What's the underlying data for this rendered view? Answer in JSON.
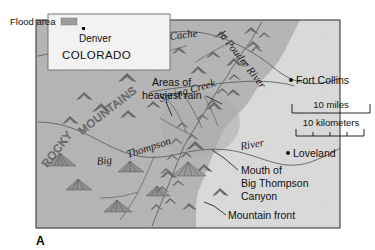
{
  "figure": {
    "label": "A",
    "panel_title": ""
  },
  "inset": {
    "legend_label": "Flood area",
    "legend_swatch_color": "#9b9b9b",
    "city": "Denver",
    "state": "COLORADO",
    "background_color": "#f2f2f2"
  },
  "map": {
    "land_color": "#b5b5b5",
    "plains_color": "#d9d9d9",
    "border_color": "#4a4a4a",
    "cities": [
      {
        "name": "Fort Collins",
        "x": 291,
        "y": 80
      },
      {
        "name": "Loveland",
        "x": 288,
        "y": 153
      }
    ],
    "rivers": [
      {
        "name": "Cache",
        "style": "italic-serif"
      },
      {
        "name": "la Poudre River",
        "style": "italic-serif"
      },
      {
        "name": "Spring Creek",
        "style": "italic-serif"
      },
      {
        "name": "Big",
        "style": "italic-serif"
      },
      {
        "name": "Thompson",
        "style": "italic-serif"
      },
      {
        "name": "River",
        "style": "italic-serif"
      }
    ],
    "range_label": "ROCKY MOUNTAINS",
    "range_words": [
      "ROCKY",
      "MOUNTAINS"
    ],
    "annotations": [
      {
        "id": "heaviest-rain",
        "line1": "Areas of",
        "line2": "heaviest rain"
      },
      {
        "id": "canyon-mouth",
        "line1": "Mouth of",
        "line2": "Big Thompson",
        "line3": "Canyon"
      },
      {
        "id": "mountain-front",
        "line1": "Mountain front"
      }
    ]
  },
  "scale": {
    "miles_label": "10 miles",
    "kilometers_label": "10 kilometers"
  }
}
